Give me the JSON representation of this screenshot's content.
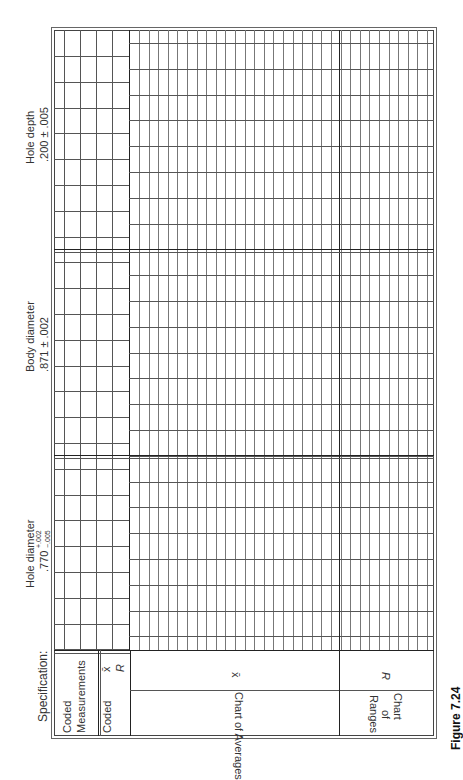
{
  "figure": {
    "caption": "Figure 7.24"
  },
  "form": {
    "specification_label": "Specification:",
    "row_labels": {
      "coded_measurements": "Coded Measurements",
      "coded_measurements_line1": "Coded",
      "coded_measurements_line2": "Measurements",
      "coded": "Coded",
      "xbar_symbol": "x̄",
      "r_symbol": "R"
    },
    "sections": [
      {
        "name": "Hole diameter",
        "spec_nominal": ".770",
        "spec_upper": "+.002",
        "spec_lower": "−.005"
      },
      {
        "name": "Body diameter",
        "spec": ".871 ± .002"
      },
      {
        "name": "Hole depth",
        "spec": ".200 ± .005"
      }
    ],
    "charts": {
      "averages": {
        "label": "Chart of Averages",
        "symbol": "x̄"
      },
      "ranges": {
        "label_line1": "Chart",
        "label_line2": "of",
        "label_line3": "Ranges",
        "symbol": "R"
      }
    }
  }
}
